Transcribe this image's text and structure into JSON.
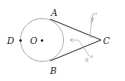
{
  "diagram": {
    "type": "geometry",
    "circle": {
      "center_label": "O",
      "cx": 42,
      "cy": 40,
      "r": 22
    },
    "points": [
      {
        "label": "A",
        "x": 50,
        "y": 19
      },
      {
        "label": "B",
        "x": 50,
        "y": 61
      },
      {
        "label": "C",
        "x": 101,
        "y": 40
      },
      {
        "label": "D",
        "x": 20,
        "y": 40
      },
      {
        "label": "O",
        "x": 42,
        "y": 40
      }
    ],
    "segments": [
      {
        "from": "A",
        "to": "C"
      },
      {
        "from": "B",
        "to": "C"
      }
    ],
    "angle_labels": [
      {
        "label": "y°",
        "text_y": "y",
        "text_deg": "o"
      },
      {
        "label": "x°",
        "text_x": "x",
        "text_deg": "o"
      }
    ],
    "colors": {
      "circle": "#b0b0b0",
      "tangent": "#555555",
      "annotation": "#a0a0a0",
      "text": "#222222"
    }
  }
}
